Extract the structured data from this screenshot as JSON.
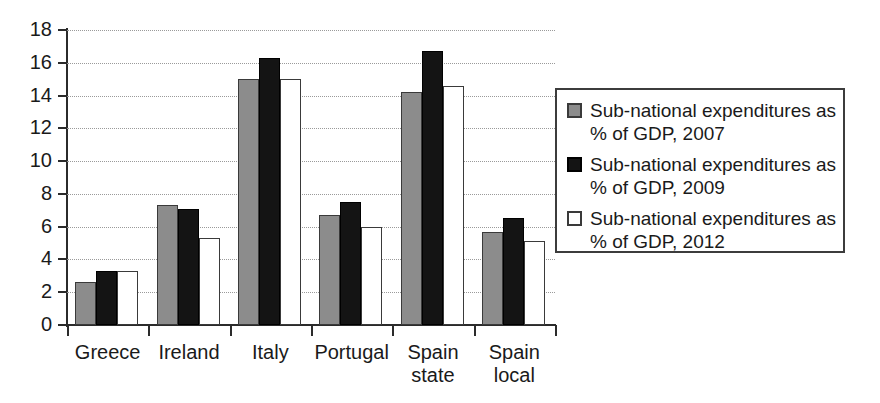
{
  "chart_data": {
    "type": "bar",
    "title": "",
    "xlabel": "",
    "ylabel": "",
    "ylim": [
      0,
      18
    ],
    "yticks": [
      0,
      2,
      4,
      6,
      8,
      10,
      12,
      14,
      16,
      18
    ],
    "grid": true,
    "legend_position": "right",
    "categories": [
      "Greece",
      "Ireland",
      "Italy",
      "Portugal",
      "Spain state",
      "Spain local"
    ],
    "category_lines": [
      [
        "Greece"
      ],
      [
        "Ireland"
      ],
      [
        "Italy"
      ],
      [
        "Portugal"
      ],
      [
        "Spain",
        "state"
      ],
      [
        "Spain",
        "local"
      ]
    ],
    "series": [
      {
        "name": "Sub-national expenditures as % of GDP, 2007",
        "color": "#8c8c8c",
        "values": [
          2.6,
          7.3,
          15.0,
          6.7,
          14.2,
          5.7
        ]
      },
      {
        "name": "Sub-national expenditures as % of GDP, 2009",
        "color": "#141414",
        "values": [
          3.3,
          7.1,
          16.3,
          7.5,
          16.7,
          6.5
        ]
      },
      {
        "name": "Sub-national expenditures as % of GDP, 2012",
        "color": "#ffffff",
        "values": [
          3.3,
          5.3,
          15.0,
          6.0,
          14.6,
          5.1
        ]
      }
    ]
  },
  "legend": {
    "items": [
      {
        "label": "Sub-national expenditures as % of GDP, 2007",
        "swatch": "gray-swatch"
      },
      {
        "label": "Sub-national expenditures as % of GDP, 2009",
        "swatch": "black-swatch"
      },
      {
        "label": "Sub-national expenditures as % of GDP, 2012",
        "swatch": "white-swatch"
      }
    ]
  },
  "axis": {
    "y_tick_labels": [
      "18",
      "16",
      "14",
      "12",
      "10",
      "8",
      "6",
      "4",
      "2",
      "0"
    ]
  }
}
